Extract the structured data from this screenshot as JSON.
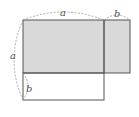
{
  "diagram": {
    "type": "geometry-area-figure",
    "labels": {
      "top_a": "a",
      "top_b": "b",
      "left_a": "a",
      "inner_b": "b"
    },
    "colors": {
      "shaded_fill": "#d9d9d9",
      "line": "#555555",
      "arc": "#999999"
    }
  }
}
